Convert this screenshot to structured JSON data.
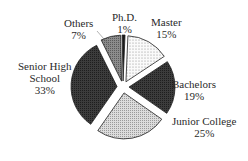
{
  "chart_data": {
    "type": "pie",
    "title": "",
    "exploded": true,
    "categories": [
      "Ph.D.",
      "Master",
      "Bachelors",
      "Junior College",
      "Senior High School",
      "Others"
    ],
    "values": [
      1,
      15,
      19,
      25,
      33,
      7
    ],
    "unit": "%",
    "labels": [
      {
        "name": "Ph.D.",
        "pct": "1%"
      },
      {
        "name": "Master",
        "pct": "15%"
      },
      {
        "name": "Bachelors",
        "pct": "19%"
      },
      {
        "name": "Junior College",
        "pct": "25%"
      },
      {
        "name_line1": "Senior High",
        "name_line2": "School",
        "pct": "33%"
      },
      {
        "name": "Others",
        "pct": "7%"
      }
    ],
    "fills": [
      "#1a1a1a",
      "#f4f4f4",
      "#262626",
      "#d6d6d6",
      "#3a3a3a",
      "#8a8a8a"
    ],
    "legend": "none"
  }
}
